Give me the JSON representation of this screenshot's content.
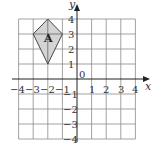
{
  "diagram": {
    "type": "coordinate-grid",
    "x_axis": {
      "label": "x",
      "ticks": [
        "-4",
        "-3",
        "-2",
        "-1",
        "1",
        "2",
        "3",
        "4"
      ],
      "range": [
        -4,
        4
      ]
    },
    "y_axis": {
      "label": "y",
      "ticks": [
        "4",
        "3",
        "2",
        "1",
        "-1",
        "-2",
        "-3",
        "-4"
      ],
      "range": [
        -4,
        4
      ]
    },
    "origin_label": "0",
    "shape": {
      "name": "kite",
      "label": "A",
      "vertices": [
        [
          -2,
          4
        ],
        [
          -1,
          3
        ],
        [
          -2,
          1
        ],
        [
          -3,
          3
        ]
      ],
      "fill": "#d4d4d4"
    }
  },
  "labels": {
    "x_axis_label": "x",
    "y_axis_label": "y",
    "origin": "0",
    "shape_label": "A",
    "xt": {
      "n4": "−4",
      "n3": "−3",
      "n2": "−2",
      "n1": "−1",
      "p1": "1",
      "p2": "2",
      "p3": "3",
      "p4": "4"
    },
    "yt": {
      "p4": "4",
      "p3": "3",
      "p2": "2",
      "p1": "1",
      "n1": "−1",
      "n2": "−2",
      "n3": "−3",
      "n4": "−4"
    }
  }
}
